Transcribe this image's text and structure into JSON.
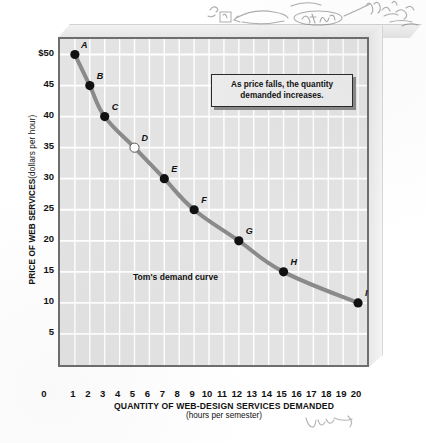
{
  "chart_data": {
    "type": "line",
    "title": "",
    "xlabel": "QUANTITY OF WEB-DESIGN SERVICES DEMANDED",
    "xlabel_sub": "(hours per semester)",
    "ylabel": "PRICE OF WEB SERVICES",
    "ylabel_sub": "(dollars per hour)",
    "series_name": "Tom's demand curve",
    "xlim": [
      0,
      20.6
    ],
    "ylim": [
      0,
      52.5
    ],
    "grid": true,
    "legend_position": "inline-annotation",
    "x": [
      1,
      2,
      3,
      5,
      7,
      9,
      12,
      15,
      20
    ],
    "values": [
      50,
      45,
      40,
      35,
      30,
      25,
      20,
      15,
      10
    ],
    "point_labels": [
      "A",
      "B",
      "C",
      "D",
      "E",
      "F",
      "G",
      "H",
      "I"
    ],
    "point_styles": [
      "filled",
      "filled",
      "filled",
      "hollow",
      "filled",
      "filled",
      "filled",
      "filled",
      "filled"
    ],
    "points": [
      {
        "label": "A",
        "x": 1,
        "y": 50,
        "style": "filled"
      },
      {
        "label": "B",
        "x": 2,
        "y": 45,
        "style": "filled"
      },
      {
        "label": "C",
        "x": 3,
        "y": 40,
        "style": "filled"
      },
      {
        "label": "D",
        "x": 5,
        "y": 35,
        "style": "hollow"
      },
      {
        "label": "E",
        "x": 7,
        "y": 30,
        "style": "filled"
      },
      {
        "label": "F",
        "x": 9,
        "y": 25,
        "style": "filled"
      },
      {
        "label": "G",
        "x": 12,
        "y": 20,
        "style": "filled"
      },
      {
        "label": "H",
        "x": 15,
        "y": 15,
        "style": "filled"
      },
      {
        "label": "I",
        "x": 20,
        "y": 10,
        "style": "filled"
      }
    ],
    "y_ticks": [
      "$50",
      "45",
      "40",
      "35",
      "30",
      "25",
      "20",
      "15",
      "10",
      "5"
    ],
    "y_tick_values": [
      50,
      45,
      40,
      35,
      30,
      25,
      20,
      15,
      10,
      5
    ],
    "x_ticks": [
      "0",
      "1",
      "2",
      "3",
      "4",
      "5",
      "6",
      "7",
      "8",
      "9",
      "10",
      "11",
      "12",
      "13",
      "14",
      "15",
      "16",
      "17",
      "18",
      "19",
      "20"
    ],
    "x_tick_values": [
      0,
      1,
      2,
      3,
      4,
      5,
      6,
      7,
      8,
      9,
      10,
      11,
      12,
      13,
      14,
      15,
      16,
      17,
      18,
      19,
      20
    ],
    "annotation": "As price falls, the quantity demanded increases.",
    "colors": {
      "curve": "#8a8a8a",
      "plot_background": "#e3e3e3",
      "gridline": "#ffffff",
      "border": "#6e6e6e",
      "point_fill": "#111111",
      "point_hollow_fill": "#ffffff",
      "callout_background": "#ebebeb"
    }
  }
}
